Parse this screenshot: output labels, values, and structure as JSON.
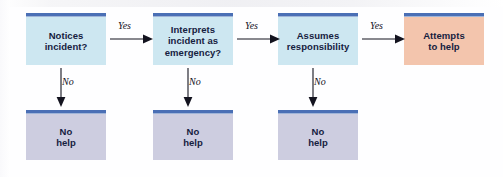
{
  "diagram": {
    "type": "decision-flowchart",
    "background_color": "#fefeff",
    "accent_bar_color": "#4a6fb5",
    "text_color": "#16213f",
    "nodes": [
      {
        "id": "notices",
        "label": "Notices\nincident?",
        "kind": "decision",
        "fill": "#cde7f1",
        "row": "top",
        "column": 1
      },
      {
        "id": "interprets",
        "label": "Interprets\nincident as\nemergency?",
        "kind": "decision",
        "fill": "#cde7f1",
        "row": "top",
        "column": 2
      },
      {
        "id": "assumes",
        "label": "Assumes\nresponsibility",
        "kind": "decision",
        "fill": "#cde7f1",
        "row": "top",
        "column": 3
      },
      {
        "id": "attempts",
        "label": "Attempts\nto help",
        "kind": "outcome",
        "fill": "#f3c5ad",
        "row": "top",
        "column": 4
      },
      {
        "id": "nohelp1",
        "label": "No\nhelp",
        "kind": "terminal",
        "fill": "#cdcde0",
        "row": "bottom",
        "column": 1
      },
      {
        "id": "nohelp2",
        "label": "No\nhelp",
        "kind": "terminal",
        "fill": "#cdcde0",
        "row": "bottom",
        "column": 2
      },
      {
        "id": "nohelp3",
        "label": "No\nhelp",
        "kind": "terminal",
        "fill": "#cdcde0",
        "row": "bottom",
        "column": 3
      }
    ],
    "edges": [
      {
        "id": "yes1",
        "from": "notices",
        "to": "interprets",
        "label": "Yes",
        "direction": "right"
      },
      {
        "id": "yes2",
        "from": "interprets",
        "to": "assumes",
        "label": "Yes",
        "direction": "right"
      },
      {
        "id": "yes3",
        "from": "assumes",
        "to": "attempts",
        "label": "Yes",
        "direction": "right"
      },
      {
        "id": "no1",
        "from": "notices",
        "to": "nohelp1",
        "label": "No",
        "direction": "down"
      },
      {
        "id": "no2",
        "from": "interprets",
        "to": "nohelp2",
        "label": "No",
        "direction": "down"
      },
      {
        "id": "no3",
        "from": "assumes",
        "to": "nohelp3",
        "label": "No",
        "direction": "down"
      }
    ]
  }
}
